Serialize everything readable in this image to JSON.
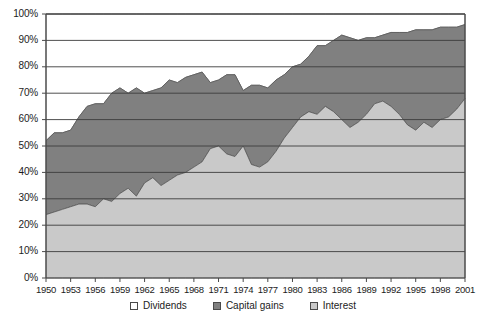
{
  "chart_data": {
    "type": "area",
    "stacked": true,
    "normalized_percent": true,
    "title": "",
    "subtitle": "",
    "xlabel": "",
    "ylabel": "",
    "xlim": [
      1950,
      2001
    ],
    "ylim": [
      0,
      100
    ],
    "grid": true,
    "legend_position": "bottom",
    "y_tick_labels": [
      "0%",
      "10%",
      "20%",
      "30%",
      "40%",
      "50%",
      "60%",
      "70%",
      "80%",
      "90%",
      "100%"
    ],
    "y_tick_values": [
      0,
      10,
      20,
      30,
      40,
      50,
      60,
      70,
      80,
      90,
      100
    ],
    "x_tick_labels": [
      "1950",
      "1953",
      "1956",
      "1959",
      "1962",
      "1965",
      "1968",
      "1971",
      "1974",
      "1977",
      "1980",
      "1983",
      "1986",
      "1989",
      "1992",
      "1995",
      "1998",
      "2001"
    ],
    "x_tick_values": [
      1950,
      1953,
      1956,
      1959,
      1962,
      1965,
      1968,
      1971,
      1974,
      1977,
      1980,
      1983,
      1986,
      1989,
      1992,
      1995,
      1998,
      2001
    ],
    "x": [
      1950,
      1951,
      1952,
      1953,
      1954,
      1955,
      1956,
      1957,
      1958,
      1959,
      1960,
      1961,
      1962,
      1963,
      1964,
      1965,
      1966,
      1967,
      1968,
      1969,
      1970,
      1971,
      1972,
      1973,
      1974,
      1975,
      1976,
      1977,
      1978,
      1979,
      1980,
      1981,
      1982,
      1983,
      1984,
      1985,
      1986,
      1987,
      1988,
      1989,
      1990,
      1991,
      1992,
      1993,
      1994,
      1995,
      1996,
      1997,
      1998,
      1999,
      2000,
      2001
    ],
    "series": [
      {
        "name": "Interest",
        "color": "#c9c9c9",
        "stack_order": 1,
        "values": [
          24,
          25,
          26,
          27,
          28,
          28,
          27,
          30,
          29,
          32,
          34,
          31,
          36,
          38,
          35,
          37,
          39,
          40,
          42,
          44,
          49,
          50,
          47,
          46,
          50,
          43,
          42,
          44,
          48,
          53,
          57,
          61,
          63,
          62,
          65,
          63,
          60,
          57,
          59,
          62,
          66,
          67,
          65,
          62,
          58,
          56,
          59,
          57,
          60,
          61,
          64,
          68
        ]
      },
      {
        "name": "Capital gains",
        "color": "#808080",
        "stack_order": 2,
        "values": [
          28,
          30,
          29,
          29,
          33,
          37,
          39,
          36,
          41,
          40,
          36,
          41,
          34,
          33,
          37,
          38,
          35,
          36,
          35,
          34,
          25,
          25,
          30,
          31,
          21,
          30,
          31,
          28,
          27,
          24,
          23,
          20,
          21,
          26,
          23,
          27,
          32,
          34,
          31,
          29,
          25,
          25,
          28,
          31,
          35,
          38,
          35,
          37,
          35,
          34,
          31,
          28
        ]
      },
      {
        "name": "Dividends",
        "color": "#ffffff",
        "stack_order": 3,
        "values": [
          48,
          45,
          45,
          44,
          39,
          35,
          34,
          34,
          30,
          28,
          30,
          28,
          30,
          29,
          28,
          25,
          26,
          24,
          23,
          22,
          26,
          25,
          23,
          23,
          29,
          27,
          27,
          28,
          25,
          23,
          20,
          19,
          16,
          12,
          12,
          10,
          8,
          9,
          10,
          9,
          9,
          8,
          7,
          7,
          7,
          6,
          6,
          6,
          5,
          5,
          5,
          4
        ]
      }
    ],
    "cumulative_boundaries": {
      "interest_top": [
        24,
        25,
        26,
        27,
        28,
        28,
        27,
        30,
        29,
        32,
        34,
        31,
        36,
        38,
        35,
        37,
        39,
        40,
        42,
        44,
        49,
        50,
        47,
        46,
        50,
        43,
        42,
        44,
        48,
        53,
        57,
        61,
        63,
        62,
        65,
        63,
        60,
        57,
        59,
        62,
        66,
        67,
        65,
        62,
        58,
        56,
        59,
        57,
        60,
        61,
        64,
        68
      ],
      "capital_gains_top": [
        52,
        55,
        55,
        56,
        61,
        65,
        66,
        66,
        70,
        72,
        70,
        72,
        70,
        71,
        72,
        75,
        74,
        76,
        77,
        78,
        74,
        75,
        77,
        77,
        71,
        73,
        73,
        72,
        75,
        77,
        80,
        81,
        84,
        88,
        88,
        90,
        92,
        91,
        90,
        91,
        91,
        92,
        93,
        93,
        93,
        94,
        94,
        94,
        95,
        95,
        95,
        96
      ]
    },
    "annotations": [
      {
        "text": "sharp capital-gains trough",
        "x": 1974,
        "y": 71
      }
    ]
  },
  "legend": {
    "items": [
      {
        "label": "Dividends",
        "swatch_color": "#ffffff"
      },
      {
        "label": "Capital gains",
        "swatch_color": "#808080"
      },
      {
        "label": "Interest",
        "swatch_color": "#c9c9c9"
      }
    ]
  },
  "colors": {
    "dividends": "#ffffff",
    "capital_gains": "#808080",
    "interest": "#c9c9c9",
    "gridline": "#3c3c3c",
    "axis": "#4a4a4a",
    "plot_background": "#f2f2f2",
    "text": "#1c1c1c"
  }
}
